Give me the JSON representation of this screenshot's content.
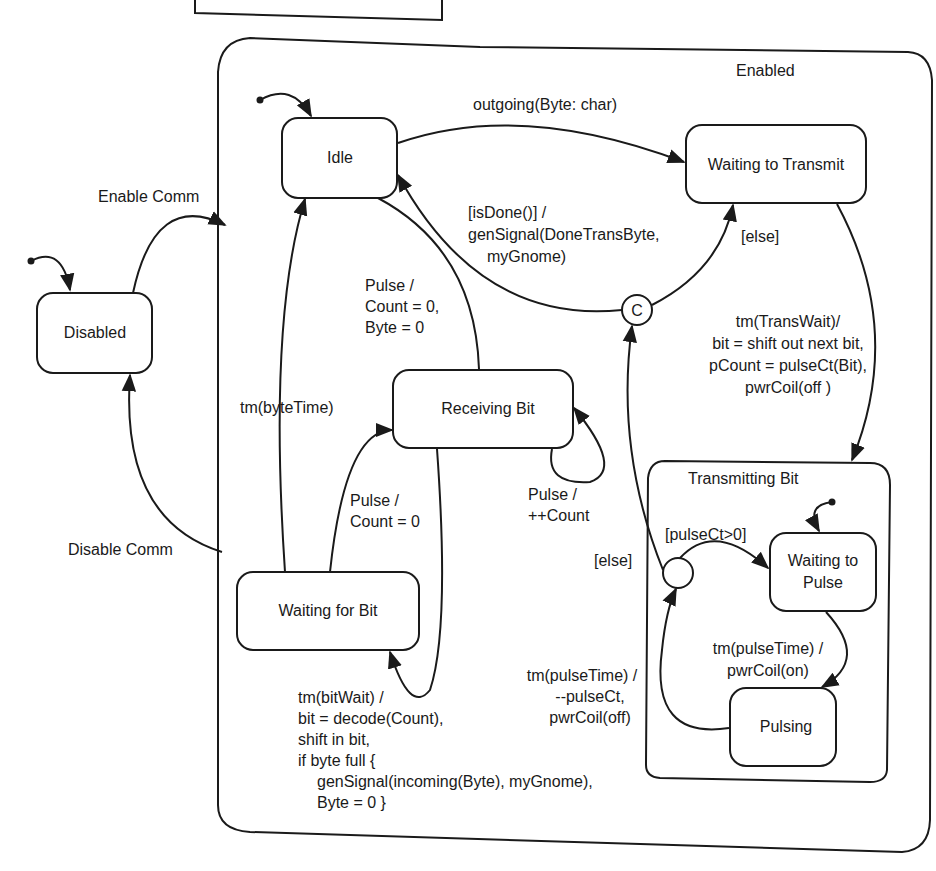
{
  "diagram": {
    "type": "UML state machine",
    "composite_enabled": {
      "label": "Enabled"
    },
    "composite_transmitting": {
      "label": "Transmitting Bit"
    },
    "states": {
      "disabled": "Disabled",
      "idle": "Idle",
      "waiting_to_transmit": "Waiting to Transmit",
      "receiving_bit": "Receiving Bit",
      "waiting_for_bit": "Waiting for Bit",
      "waiting_to_pulse_1": "Waiting to",
      "waiting_to_pulse_2": "Pulse",
      "pulsing": "Pulsing"
    },
    "pseudostates": {
      "choice_c": "C"
    },
    "transitions": {
      "enable_comm": "Enable Comm",
      "disable_comm": "Disable Comm",
      "outgoing": "outgoing(Byte: char)",
      "is_done": [
        "[isDone()] /",
        "genSignal(DoneTransByte,",
        "myGnome)"
      ],
      "else_top": "[else]",
      "pulse_reset": [
        "Pulse /",
        "Count = 0,",
        "Byte = 0"
      ],
      "byte_time": "tm(byteTime)",
      "pulse_count0": [
        "Pulse /",
        "Count = 0"
      ],
      "pulse_inc": [
        "Pulse /",
        "++Count"
      ],
      "bit_wait": [
        "tm(bitWait) /",
        "bit = decode(Count),",
        "shift in bit,",
        "if byte full {",
        "genSignal(incoming(Byte), myGnome),",
        "Byte = 0 }"
      ],
      "trans_wait": [
        "tm(TransWait)/",
        "bit = shift out next bit,",
        "pCount = pulseCt(Bit),",
        "pwrCoil(off )"
      ],
      "pulse_ct_gt0": "[pulseCt>0]",
      "else_bottom": "[else]",
      "pulse_time_on": [
        "tm(pulseTime) /",
        "pwrCoil(on)"
      ],
      "pulse_time_off": [
        "tm(pulseTime) /",
        "--pulseCt,",
        "pwrCoil(off)"
      ]
    }
  }
}
